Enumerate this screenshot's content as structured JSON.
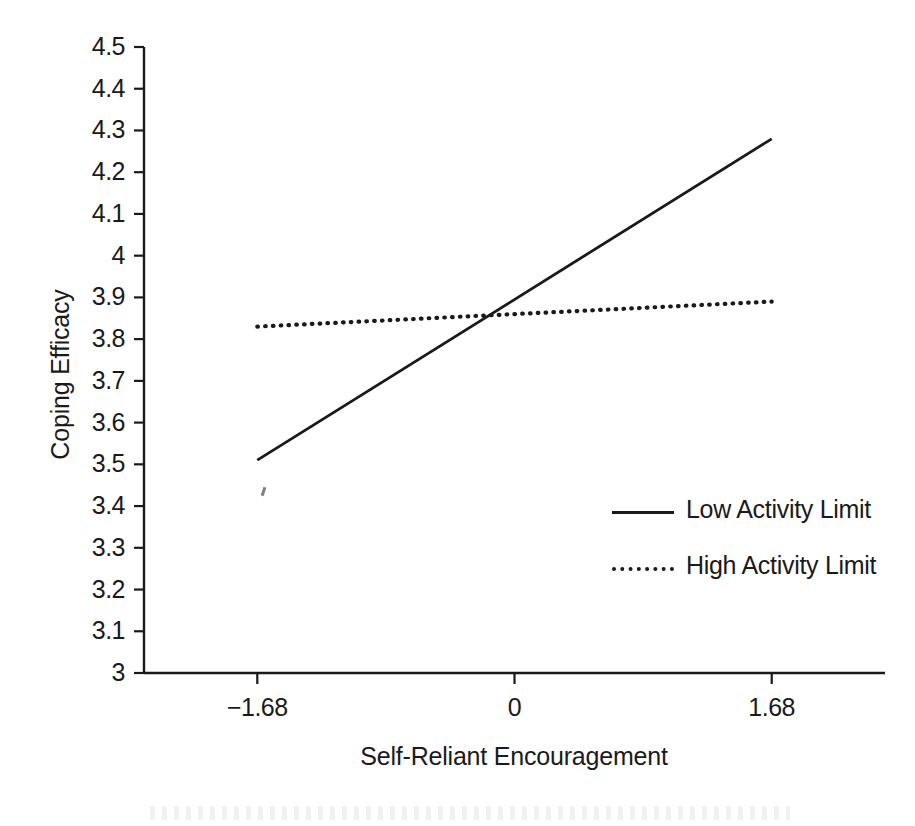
{
  "chart_data": {
    "type": "line",
    "title": "",
    "xlabel": "Self-Reliant Encouragement",
    "ylabel": "Coping Efficacy",
    "xlim": [
      -2.42,
      2.42
    ],
    "ylim": [
      3,
      4.5
    ],
    "grid": false,
    "legend_position": "inside-right-center",
    "x": [
      -1.68,
      1.68
    ],
    "xticks": [
      -1.68,
      0,
      1.68
    ],
    "xtick_labels": [
      "−1.68",
      "0",
      "1.68"
    ],
    "yticks": [
      3,
      3.1,
      3.2,
      3.3,
      3.4,
      3.5,
      3.6,
      3.7,
      3.8,
      3.9,
      4,
      4.1,
      4.2,
      4.3,
      4.4,
      4.5
    ],
    "ytick_labels": [
      "3",
      "3.1",
      "3.2",
      "3.3",
      "3.4",
      "3.5",
      "3.6",
      "3.7",
      "3.8",
      "3.9",
      "4",
      "4.1",
      "4.2",
      "4.3",
      "4.4",
      "4.5"
    ],
    "series": [
      {
        "name": "Low Activity Limit",
        "style": "solid",
        "color": "#1a1a1a",
        "values": [
          3.51,
          4.28
        ]
      },
      {
        "name": "High Activity Limit",
        "style": "dotted",
        "color": "#1a1a1a",
        "values": [
          3.83,
          3.89
        ]
      }
    ]
  },
  "axes": {
    "y_title": "Coping Efficacy",
    "x_title": "Self-Reliant Encouragement"
  },
  "legend": {
    "items": [
      {
        "label": "Low Activity Limit",
        "style": "solid"
      },
      {
        "label": "High Activity Limit",
        "style": "dotted"
      }
    ]
  }
}
